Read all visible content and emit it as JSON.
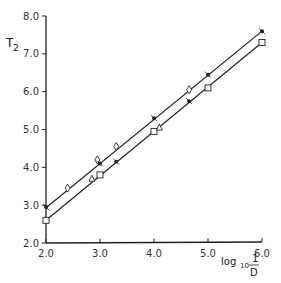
{
  "chart_data": {
    "type": "scatter",
    "title": "",
    "ylabel": "T2",
    "xlabel": "log10 1/D",
    "xlim": [
      2.0,
      6.0
    ],
    "ylim": [
      2.0,
      8.0
    ],
    "x_ticks": [
      "2.0",
      "3.0",
      "4.0",
      "5.0",
      "6.0"
    ],
    "y_ticks": [
      "2.0",
      "3.0",
      "4.0",
      "5.0",
      "6.0",
      "7.0",
      "8.0"
    ],
    "grid": false,
    "legend": null,
    "series": [
      {
        "name": "upper fit line",
        "kind": "line",
        "x": [
          2.0,
          6.0
        ],
        "y": [
          2.93,
          7.6
        ]
      },
      {
        "name": "lower fit line",
        "kind": "line",
        "x": [
          2.0,
          6.0
        ],
        "y": [
          2.6,
          7.3
        ]
      },
      {
        "name": "upper points (diamond)",
        "marker": "diamond",
        "x": [
          2.4,
          2.95,
          3.3,
          4.65
        ],
        "y": [
          3.45,
          4.2,
          4.55,
          6.05
        ]
      },
      {
        "name": "upper points (cross)",
        "marker": "cross",
        "x": [
          2.0,
          3.0,
          4.0,
          5.0,
          6.0
        ],
        "y": [
          2.95,
          4.1,
          5.3,
          6.45,
          7.6
        ]
      },
      {
        "name": "lower points (square)",
        "marker": "square",
        "x": [
          2.0,
          3.0,
          4.0,
          5.0,
          6.0
        ],
        "y": [
          2.6,
          3.8,
          4.95,
          6.1,
          7.3
        ]
      },
      {
        "name": "lower points (triangle)",
        "marker": "triangle",
        "x": [
          2.85,
          4.1
        ],
        "y": [
          3.7,
          5.05
        ]
      },
      {
        "name": "lower points (cross)",
        "marker": "cross",
        "x": [
          3.3,
          4.65
        ],
        "y": [
          4.15,
          5.75
        ]
      }
    ]
  },
  "labels": {
    "y_title_main": "T",
    "y_title_sub": "2",
    "x_title_log": "log",
    "x_title_base": "10",
    "x_title_num": "1",
    "x_title_den": "D"
  }
}
